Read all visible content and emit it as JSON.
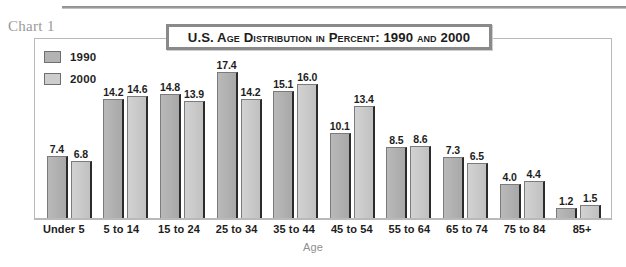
{
  "caption": "Chart 1",
  "title": "U.S. Age Distribution in Percent: 1990 and 2000",
  "axis_title": "Age",
  "legend": [
    {
      "label": "1990",
      "color": "#b3b3b3"
    },
    {
      "label": "2000",
      "color": "#cdcdcd"
    }
  ],
  "chart_data": {
    "type": "bar",
    "title": "U.S. Age Distribution in Percent: 1990 and 2000",
    "xlabel": "Age",
    "ylabel": "",
    "ylim": [
      0,
      18
    ],
    "grid": false,
    "legend_position": "top-left",
    "categories": [
      "Under 5",
      "5 to 14",
      "15 to 24",
      "25 to 34",
      "35 to 44",
      "45 to 54",
      "55 to 64",
      "65 to 74",
      "75 to 84",
      "85+"
    ],
    "series": [
      {
        "name": "1990",
        "color": "#b3b3b3",
        "values": [
          7.4,
          14.2,
          14.8,
          17.4,
          15.1,
          10.1,
          8.5,
          7.3,
          4.0,
          1.2
        ],
        "labels": [
          "7.4",
          "14.2",
          "14.8",
          "17.4",
          "15.1",
          "10.1",
          "8.5",
          "7.3",
          "4.0",
          "1.2"
        ]
      },
      {
        "name": "2000",
        "color": "#cdcdcd",
        "values": [
          6.8,
          14.6,
          13.9,
          14.2,
          16.0,
          13.4,
          8.6,
          6.5,
          4.4,
          1.5
        ],
        "labels": [
          "6.8",
          "14.6",
          "13.9",
          "14.2",
          "16.0",
          "13.4",
          "8.6",
          "6.5",
          "4.4",
          "1.5"
        ]
      }
    ]
  }
}
